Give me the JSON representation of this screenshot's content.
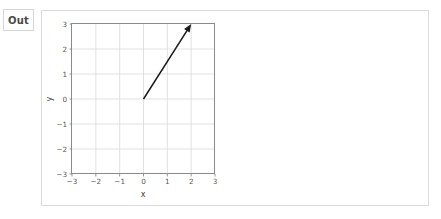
{
  "cell": {
    "out_label": "Out"
  },
  "chart_data": {
    "type": "line",
    "title": "",
    "subtitle": "",
    "xlabel": "x",
    "ylabel": "y",
    "xlim": [
      -3,
      3
    ],
    "ylim": [
      -3,
      3
    ],
    "grid": true,
    "legend": null,
    "x_ticks": [
      "-3",
      "-2",
      "-1",
      "0",
      "1",
      "2",
      "3"
    ],
    "x_tick_values": [
      -3,
      -2,
      -1,
      0,
      1,
      2,
      3
    ],
    "y_ticks": [
      "-3",
      "-2",
      "-1",
      "0",
      "1",
      "2",
      "3"
    ],
    "y_tick_values": [
      -3,
      -2,
      -1,
      0,
      1,
      2,
      3
    ],
    "annotations": [
      {
        "kind": "arrow",
        "label": "vector",
        "start": [
          0,
          0
        ],
        "end": [
          2,
          3
        ],
        "color": "#1a1a1a"
      }
    ],
    "series": [
      {
        "name": "vector",
        "x": [
          0,
          2
        ],
        "values": [
          0,
          3
        ],
        "color": "#1a1a1a",
        "arrow": true
      }
    ]
  },
  "colors": {
    "grid": "#d9d9d9",
    "spine": "#8a8a8a",
    "vector": "#1a1a1a",
    "card_border": "#dcdcdc",
    "label_border": "#d6d6d6",
    "tick_text": "#555555",
    "axis_title": "#3c3c3c"
  }
}
